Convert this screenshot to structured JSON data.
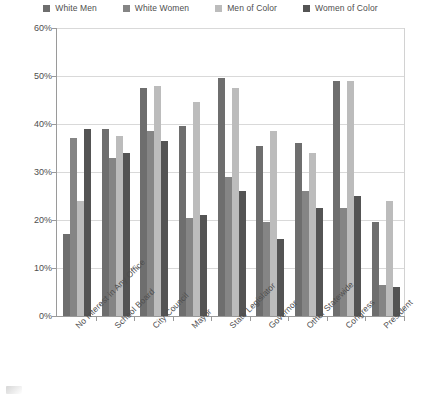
{
  "chart_data": {
    "type": "bar",
    "title": "",
    "subtitle": "",
    "xlabel": "",
    "ylabel": "",
    "ylim": [
      0,
      60
    ],
    "ytick_labels": [
      "0%",
      "10%",
      "20%",
      "30%",
      "40%",
      "50%",
      "60%"
    ],
    "ytick_values": [
      0,
      10,
      20,
      30,
      40,
      50,
      60
    ],
    "grid": true,
    "legend_position": "top",
    "categories": [
      "No Interest in Any Office",
      "School Board",
      "City Council",
      "Mayor",
      "State Legislator",
      "Governor",
      "Other Statewide",
      "Congress",
      "President"
    ],
    "series": [
      {
        "name": "White Men",
        "color": "#6e6e6e",
        "values": [
          17,
          39,
          47.5,
          39.5,
          49.5,
          35.5,
          36,
          49,
          19.5
        ]
      },
      {
        "name": "White Women",
        "color": "#858585",
        "values": [
          37,
          33,
          38.5,
          20.5,
          29,
          19.5,
          26,
          22.5,
          6.5
        ]
      },
      {
        "name": "Men of Color",
        "color": "#bcbcbc",
        "values": [
          24,
          37.5,
          48,
          44.5,
          47.5,
          38.5,
          34,
          49,
          24
        ]
      },
      {
        "name": "Women of Color",
        "color": "#545454",
        "values": [
          39,
          34,
          36.5,
          21,
          26,
          16,
          22.5,
          25,
          6
        ]
      }
    ]
  },
  "legend": {
    "items": [
      {
        "label": "White Men",
        "swatch_icon": "legend-swatch-icon"
      },
      {
        "label": "White Women",
        "swatch_icon": "legend-swatch-icon"
      },
      {
        "label": "Men of Color",
        "swatch_icon": "legend-swatch-icon"
      },
      {
        "label": "Women of Color",
        "swatch_icon": "legend-swatch-icon"
      }
    ]
  },
  "colors": {
    "white_men": "#6e6e6e",
    "white_women": "#858585",
    "men_of_color": "#bcbcbc",
    "women_of_color": "#545454",
    "gridline": "#d9d9d9",
    "axis": "#9a9a9a",
    "text": "#4e4e4e",
    "background": "#ffffff"
  }
}
